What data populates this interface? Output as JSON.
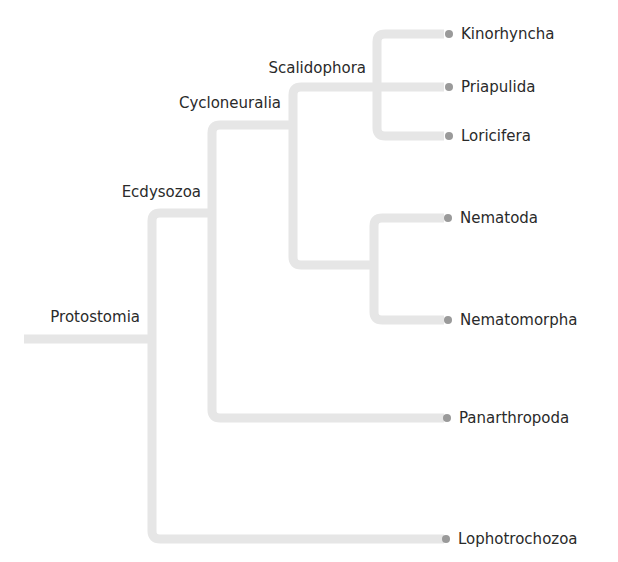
{
  "tree": {
    "line_color": "#e6e6e6",
    "dot_color": "#9a9a9a",
    "text_color": "#2a2a2a",
    "nodes": [
      {
        "label": "Protostomia",
        "x": 152,
        "y": 339,
        "label_x": 140,
        "label_y": 322
      },
      {
        "label": "Ecdysozoa",
        "x": 212,
        "y": 213,
        "label_x": 201,
        "label_y": 197
      },
      {
        "label": "Cycloneuralia",
        "x": 293,
        "y": 125,
        "label_x": 279,
        "label_y": 108
      },
      {
        "label": "Scalidophora",
        "x": 377,
        "y": 87,
        "label_x": 366,
        "label_y": 73
      }
    ],
    "tips": [
      {
        "label": "Kinorhyncha",
        "y": 34
      },
      {
        "label": "Priapulida",
        "y": 87
      },
      {
        "label": "Loricifera",
        "y": 136
      },
      {
        "label": "Nematoda",
        "y": 218
      },
      {
        "label": "Nematomorpha",
        "y": 320
      },
      {
        "label": "Panarthropoda",
        "y": 418
      },
      {
        "label": "Lophotrochozoa",
        "y": 539
      }
    ]
  }
}
